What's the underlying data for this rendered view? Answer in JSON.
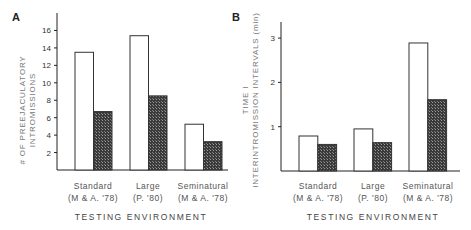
{
  "chart_data": [
    {
      "panel": "A",
      "type": "bar",
      "title": "",
      "categories": [
        "Standard (M & A. '78)",
        "Large (P. '80)",
        "Seminatural (M & A. '78)"
      ],
      "category_lines": [
        [
          "Standard",
          "(M & A. '78)"
        ],
        [
          "Large",
          "(P. '80)"
        ],
        [
          "Seminatural",
          "(M & A. '78)"
        ]
      ],
      "series": [
        {
          "name": "open",
          "fill": "#ffffff",
          "values": [
            13.5,
            15.4,
            5.25
          ]
        },
        {
          "name": "hatched",
          "fill": "#3a3a3a",
          "values": [
            6.7,
            8.5,
            3.25
          ]
        }
      ],
      "xlabel": "TESTING ENVIRONMENT",
      "ylabel": [
        "# OF PREEJACULATORY",
        "INTROMISSIONS"
      ],
      "yticks": [
        2,
        4,
        6,
        8,
        10,
        12,
        14,
        16
      ],
      "ylim": [
        0,
        17.5
      ],
      "grid": false,
      "legend": null
    },
    {
      "panel": "B",
      "type": "bar",
      "title": "",
      "categories": [
        "Standard (M & A. '78)",
        "Large (P. '80)",
        "Seminatural (M & A. '78)"
      ],
      "category_lines": [
        [
          "Standard",
          "(M & A. '78)"
        ],
        [
          "Large",
          "(P. '80)"
        ],
        [
          "Seminatural",
          "(M & A. '78)"
        ]
      ],
      "series": [
        {
          "name": "open",
          "fill": "#ffffff",
          "values": [
            0.79,
            0.95,
            2.89
          ]
        },
        {
          "name": "hatched",
          "fill": "#3a3a3a",
          "values": [
            0.6,
            0.64,
            1.61
          ]
        }
      ],
      "xlabel": "TESTING ENVIRONMENT",
      "ylabel": [
        "TIME I",
        "INTERINTROMISSION INTERVALS (min)"
      ],
      "yticks": [
        1,
        2,
        3
      ],
      "ylim": [
        0,
        3.4
      ],
      "grid": false,
      "legend": null
    }
  ],
  "panels": {
    "a": {
      "label": "A"
    },
    "b": {
      "label": "B"
    }
  }
}
